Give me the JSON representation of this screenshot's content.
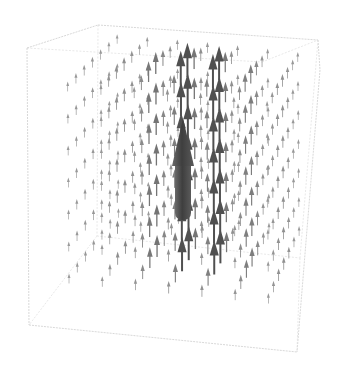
{
  "chart_data": {
    "type": "vector-field-3d",
    "title": "",
    "xlabel": "",
    "ylabel": "",
    "zlabel": "",
    "axes_shown": false,
    "bounding_box": true,
    "field_direction": "+z (all arrows point upward)",
    "grid_counts": {
      "x": 7,
      "y": 7,
      "z": 7
    },
    "magnitude_profile": "largest at center column, decaying radially outward",
    "arrow_color_range": [
      "#9a9a9a",
      "#3c3c3c"
    ],
    "box_corners_px": {
      "front_top_left": [
        27,
        48
      ],
      "back_top_left": [
        98,
        25
      ],
      "back_top_right": [
        318,
        40
      ],
      "front_top_right": [
        262,
        62
      ],
      "front_bottom_left": [
        29,
        325
      ],
      "back_bottom_left": [
        97,
        236
      ],
      "back_bottom_right": [
        300,
        258
      ],
      "front_bottom_right": [
        297,
        352
      ]
    },
    "center_arrow": {
      "x_px": 183,
      "base_y_px": 220,
      "tip_y_px": 118,
      "color": "#4a4a4a"
    }
  },
  "colors": {
    "background": "#ffffff",
    "box": "#d4d4d4",
    "arrow_light": "#9c9c9c",
    "arrow_dark": "#404040"
  }
}
